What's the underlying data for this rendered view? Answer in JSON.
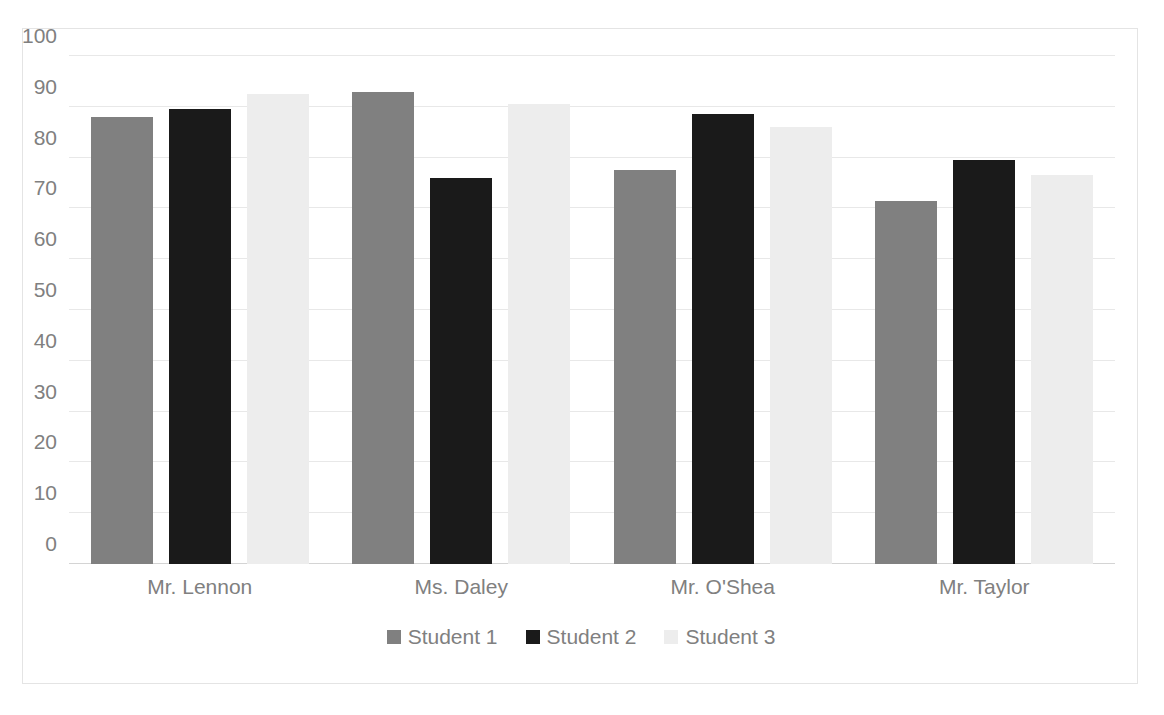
{
  "chart_data": {
    "type": "bar",
    "title": "",
    "xlabel": "",
    "ylabel": "",
    "ylim": [
      0,
      100
    ],
    "yticks": [
      0,
      10,
      20,
      30,
      40,
      50,
      60,
      70,
      80,
      90,
      100
    ],
    "grid": true,
    "legend_position": "bottom",
    "categories": [
      "Mr. Lennon",
      "Ms. Daley",
      "Mr. O'Shea",
      "Mr. Taylor"
    ],
    "series": [
      {
        "name": "Student 1",
        "color": "#808080",
        "values": [
          88,
          93,
          77.5,
          71.5
        ]
      },
      {
        "name": "Student 2",
        "color": "#1a1a1a",
        "values": [
          89.5,
          76,
          88.5,
          79.5
        ]
      },
      {
        "name": "Student 3",
        "color": "#ededed",
        "values": [
          92.5,
          90.5,
          86,
          76.5
        ]
      }
    ]
  },
  "legend": {
    "items": [
      {
        "label": "Student 1",
        "color": "#808080"
      },
      {
        "label": "Student 2",
        "color": "#1a1a1a"
      },
      {
        "label": "Student 3",
        "color": "#ededed"
      }
    ]
  },
  "axis": {
    "y_tick_labels": [
      "100",
      "90",
      "80",
      "70",
      "60",
      "50",
      "40",
      "30",
      "20",
      "10",
      "0"
    ],
    "x_tick_labels": [
      "Mr. Lennon",
      "Ms. Daley",
      "Mr. O'Shea",
      "Mr. Taylor"
    ]
  },
  "colors": {
    "series_1": "#808080",
    "series_2": "#1a1a1a",
    "series_3": "#ededed",
    "gridline": "#e8e8e8",
    "text": "#808080",
    "frame": "#e4e4e4"
  }
}
